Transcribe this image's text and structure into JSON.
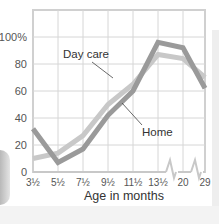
{
  "chart_data": {
    "type": "line",
    "title": "",
    "xlabel": "Age in months",
    "ylabel": "",
    "categories": [
      "3½",
      "5½",
      "7½",
      "9½",
      "11½",
      "13½",
      "20",
      "29"
    ],
    "y_ticks": [
      "0",
      "20",
      "40",
      "60",
      "80",
      "100%"
    ],
    "ylim": [
      0,
      100
    ],
    "grid": true,
    "axis_breaks": [
      "between 13½ and 20",
      "between 20 and 29"
    ],
    "series": [
      {
        "name": "Day care",
        "color": "#c8c8c8",
        "values": [
          10,
          14,
          27,
          50,
          65,
          87,
          84,
          70
        ]
      },
      {
        "name": "Home",
        "color": "#9a9a9a",
        "values": [
          32,
          7,
          17,
          42,
          60,
          96,
          92,
          62
        ]
      }
    ],
    "annotations": [
      {
        "text": "Day care",
        "points_to": "Day care series near 9½–11½"
      },
      {
        "text": "Home",
        "points_to": "Home series near 11½"
      }
    ],
    "legend_position": "inline labels"
  }
}
